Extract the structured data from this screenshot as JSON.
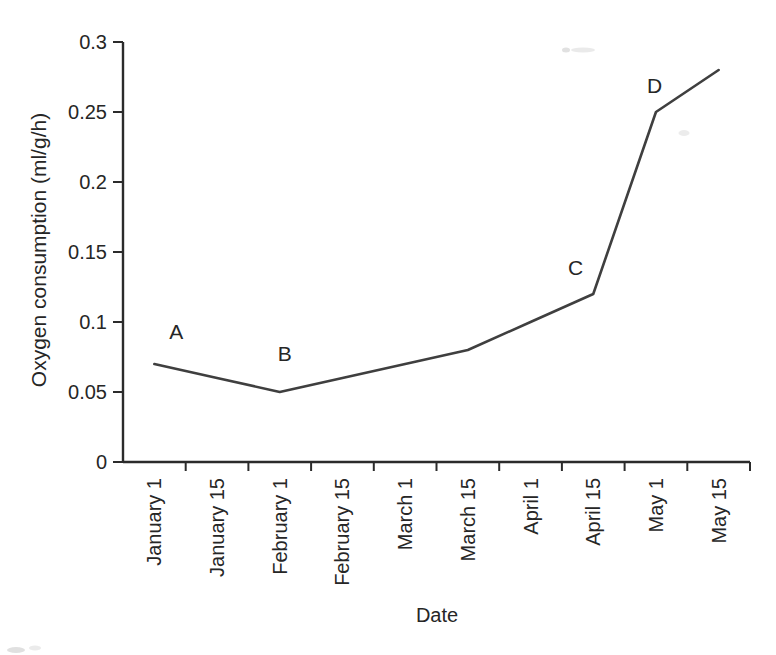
{
  "chart_data": {
    "type": "line",
    "title": "",
    "xlabel": "Date",
    "ylabel": "Oxygen consumption (ml/g/h)",
    "categories": [
      "January 1",
      "January 15",
      "February 1",
      "February 15",
      "March 1",
      "March 15",
      "April 1",
      "April 15",
      "May 1",
      "May 15"
    ],
    "values": [
      0.07,
      0.06,
      0.05,
      0.06,
      0.07,
      0.08,
      0.1,
      0.12,
      0.25,
      0.28
    ],
    "ylim": [
      0,
      0.3
    ],
    "y_ticks": [
      0,
      0.05,
      0.1,
      0.15,
      0.2,
      0.25,
      0.3
    ],
    "y_tick_labels": [
      "0",
      "0.05",
      "0.1",
      "0.15",
      "0.2",
      "0.25",
      "0.3"
    ],
    "grid": false,
    "legend": "none",
    "line_color": "#3f3f3f",
    "axis_color": "#2b2b2b",
    "text_color": "#262626",
    "annotations": [
      {
        "text": "A",
        "x": 0.35,
        "y": 0.0935
      },
      {
        "text": "B",
        "x": 2.08,
        "y": 0.0775
      },
      {
        "text": "C",
        "x": 6.72,
        "y": 0.139
      },
      {
        "text": "D",
        "x": 7.98,
        "y": 0.269
      }
    ]
  }
}
